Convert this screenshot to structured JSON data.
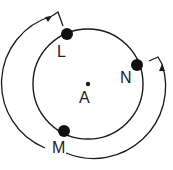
{
  "diagram": {
    "center_label": "A",
    "points": [
      {
        "name": "L",
        "label": "L"
      },
      {
        "name": "N",
        "label": "N"
      },
      {
        "name": "M",
        "label": "M"
      }
    ],
    "arrows": [
      {
        "name": "arrow-M-to-L",
        "from": "M",
        "to": "L",
        "direction": "clockwise-outer"
      },
      {
        "name": "arrow-M-to-N",
        "from": "M",
        "to": "N",
        "direction": "counterclockwise-outer"
      }
    ],
    "colors": {
      "stroke": "#1a1a1a",
      "background": "#ffffff"
    }
  }
}
